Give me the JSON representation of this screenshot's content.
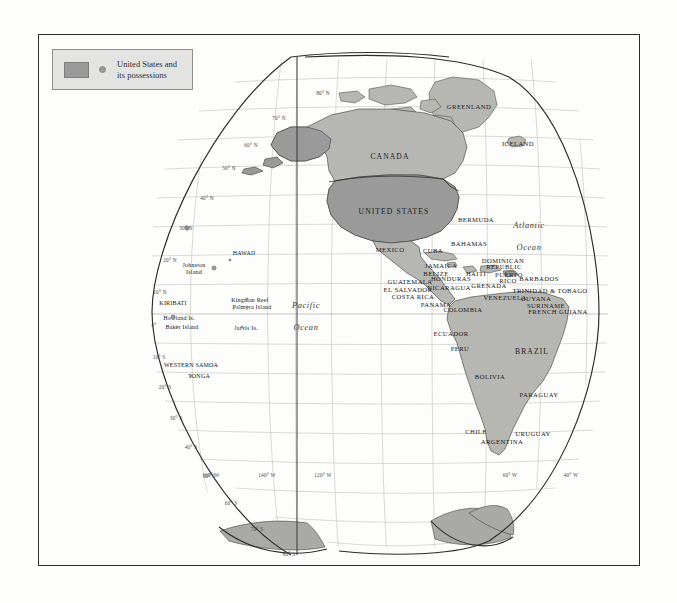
{
  "legend": {
    "swatch_name": "united-states-fill-swatch",
    "dot_name": "possession-dot-swatch",
    "line1": "United States and",
    "line2": "its possessions",
    "fill_color": "#9a9a9a",
    "box_color": "#e3e3e1"
  },
  "map": {
    "projection": "interrupted-sinusoidal",
    "highlight_color": "#9a9a9a",
    "land_color": "#b6b6b3",
    "graticule_color": "#b9b9b4",
    "coast_color": "#3a3a36",
    "ocean_color": "#fdfdfb"
  },
  "oceans": [
    {
      "name": "pacific-ocean-label",
      "line1": "Pacific",
      "line2": "Ocean",
      "x": 267,
      "y": 270
    },
    {
      "name": "atlantic-ocean-label",
      "line1": "Atlantic",
      "line2": "Ocean",
      "x": 490,
      "y": 190
    }
  ],
  "countries": [
    {
      "label": "CANADA",
      "x": 351,
      "y": 121,
      "size": "ctry-md"
    },
    {
      "label": "UNITED STATES",
      "x": 355,
      "y": 176,
      "size": "ctry-md"
    },
    {
      "label": "GREENLAND",
      "x": 430,
      "y": 71,
      "size": "ctry"
    },
    {
      "label": "ICELAND",
      "x": 479,
      "y": 108,
      "size": "ctry"
    },
    {
      "label": "BERMUDA",
      "x": 437,
      "y": 184,
      "size": "ctry"
    },
    {
      "label": "MEXICO",
      "x": 351,
      "y": 214,
      "size": "ctry"
    },
    {
      "label": "BAHAMAS",
      "x": 430,
      "y": 208,
      "size": "ctry"
    },
    {
      "label": "CUBA",
      "x": 394,
      "y": 215,
      "size": "ctry"
    },
    {
      "label": "JAMAICA",
      "x": 402,
      "y": 230,
      "size": "ctry"
    },
    {
      "label": "HAITI",
      "x": 437,
      "y": 238,
      "size": "ctry"
    },
    {
      "label": "DOMINICAN",
      "x": 464,
      "y": 225,
      "size": "ctry"
    },
    {
      "label": "REPUBLIC",
      "x": 465,
      "y": 231,
      "size": "ctry"
    },
    {
      "label": "PUERTO",
      "x": 470,
      "y": 239,
      "size": "ctry"
    },
    {
      "label": "RICO",
      "x": 469,
      "y": 245,
      "size": "ctry"
    },
    {
      "label": "BELIZE",
      "x": 397,
      "y": 238,
      "size": "ctry"
    },
    {
      "label": "HONDURAS",
      "x": 412,
      "y": 243,
      "size": "ctry"
    },
    {
      "label": "GUATEMALA",
      "x": 371,
      "y": 246,
      "size": "ctry"
    },
    {
      "label": "EL SALVADOR",
      "x": 369,
      "y": 254,
      "size": "ctry"
    },
    {
      "label": "NICARAGUA",
      "x": 410,
      "y": 252,
      "size": "ctry"
    },
    {
      "label": "COSTA RICA",
      "x": 374,
      "y": 261,
      "size": "ctry"
    },
    {
      "label": "PANAMA",
      "x": 397,
      "y": 269,
      "size": "ctry"
    },
    {
      "label": "GRENADA",
      "x": 450,
      "y": 250,
      "size": "ctry"
    },
    {
      "label": "BARBADOS",
      "x": 500,
      "y": 243,
      "size": "ctry"
    },
    {
      "label": "TRINIDAD & TOBAGO",
      "x": 511,
      "y": 255,
      "size": "ctry"
    },
    {
      "label": "GUYANA",
      "x": 497,
      "y": 263,
      "size": "ctry"
    },
    {
      "label": "SURINAME",
      "x": 507,
      "y": 270,
      "size": "ctry"
    },
    {
      "label": "FRENCH GUIANA",
      "x": 519,
      "y": 276,
      "size": "ctry"
    },
    {
      "label": "VENEZUELA",
      "x": 466,
      "y": 262,
      "size": "ctry"
    },
    {
      "label": "COLOMBIA",
      "x": 424,
      "y": 274,
      "size": "ctry"
    },
    {
      "label": "ECUADOR",
      "x": 412,
      "y": 298,
      "size": "ctry"
    },
    {
      "label": "PERU",
      "x": 421,
      "y": 313,
      "size": "ctry"
    },
    {
      "label": "BRAZIL",
      "x": 493,
      "y": 316,
      "size": "ctry-md"
    },
    {
      "label": "BOLIVIA",
      "x": 451,
      "y": 341,
      "size": "ctry"
    },
    {
      "label": "PARAGUAY",
      "x": 500,
      "y": 359,
      "size": "ctry"
    },
    {
      "label": "CHILE",
      "x": 437,
      "y": 396,
      "size": "ctry"
    },
    {
      "label": "ARGENTINA",
      "x": 463,
      "y": 406,
      "size": "ctry"
    },
    {
      "label": "URUGUAY",
      "x": 494,
      "y": 398,
      "size": "ctry"
    }
  ],
  "islands": [
    {
      "label": "HAWAII",
      "x": 205,
      "y": 218,
      "dot_x": 190,
      "dot_y": 224,
      "dot": "sm",
      "align": "left"
    },
    {
      "label": "Johnston",
      "x": 155,
      "y": 230,
      "size": "isl"
    },
    {
      "label": "Island",
      "x": 155,
      "y": 237,
      "size": "isl"
    },
    {
      "label": "KIRIBATI",
      "x": 134,
      "y": 268,
      "size": "isl"
    },
    {
      "label": "Kingman Reef",
      "x": 211,
      "y": 265,
      "size": "isl",
      "align": "left"
    },
    {
      "label": "Palmyra Island",
      "x": 213,
      "y": 272,
      "size": "isl",
      "align": "left"
    },
    {
      "label": "Howland Is.",
      "x": 140,
      "y": 283,
      "size": "isl",
      "align": "left"
    },
    {
      "label": "Baker Island",
      "x": 143,
      "y": 292,
      "size": "isl",
      "align": "left"
    },
    {
      "label": "Jarvis Is.",
      "x": 207,
      "y": 293,
      "size": "isl",
      "align": "left"
    },
    {
      "label": "WESTERN SAMOA",
      "x": 152,
      "y": 330,
      "size": "isl"
    },
    {
      "label": "TONGA",
      "x": 160,
      "y": 341,
      "size": "isl"
    }
  ],
  "island_dots": [
    {
      "name": "wake-island-dot",
      "x": 148,
      "y": 193,
      "sz": ""
    },
    {
      "name": "johnston-island-dot",
      "x": 175,
      "y": 233,
      "sz": ""
    },
    {
      "name": "hawaii-dot",
      "x": 191,
      "y": 225,
      "sz": "sm"
    },
    {
      "name": "kingman-reef-dot",
      "x": 208,
      "y": 264,
      "sz": "sm"
    },
    {
      "name": "palmyra-island-dot",
      "x": 208,
      "y": 272,
      "sz": "sm"
    },
    {
      "name": "howland-island-dot",
      "x": 134,
      "y": 282,
      "sz": ""
    },
    {
      "name": "baker-island-dot",
      "x": 138,
      "y": 292,
      "sz": "sm"
    },
    {
      "name": "jarvis-island-dot",
      "x": 203,
      "y": 292,
      "sz": "sm"
    },
    {
      "name": "tonga-dot",
      "x": 152,
      "y": 341,
      "sz": "sm"
    },
    {
      "name": "midway-dot",
      "x": 148,
      "y": 194,
      "sz": "sm"
    }
  ],
  "graticule": {
    "latitude_labels": [
      {
        "text": "80° N",
        "x": 284,
        "y": 58
      },
      {
        "text": "70° N",
        "x": 240,
        "y": 83
      },
      {
        "text": "60° N",
        "x": 212,
        "y": 110
      },
      {
        "text": "50° N",
        "x": 190,
        "y": 133
      },
      {
        "text": "40° N",
        "x": 168,
        "y": 163
      },
      {
        "text": "30° N",
        "x": 147,
        "y": 193
      },
      {
        "text": "20° N",
        "x": 131,
        "y": 225
      },
      {
        "text": "10° N",
        "x": 121,
        "y": 257
      },
      {
        "text": "0°",
        "x": 115,
        "y": 290
      },
      {
        "text": "10° S",
        "x": 120,
        "y": 322
      },
      {
        "text": "20° S",
        "x": 126,
        "y": 352
      },
      {
        "text": "30° S",
        "x": 137,
        "y": 383
      },
      {
        "text": "40° S",
        "x": 152,
        "y": 412
      },
      {
        "text": "50° S",
        "x": 170,
        "y": 441
      },
      {
        "text": "60° S",
        "x": 192,
        "y": 468
      },
      {
        "text": "70° S",
        "x": 218,
        "y": 494
      },
      {
        "text": "80° S",
        "x": 250,
        "y": 519
      }
    ],
    "longitude_labels": [
      {
        "text": "160° W",
        "x": 172,
        "y": 440
      },
      {
        "text": "140° W",
        "x": 228,
        "y": 440
      },
      {
        "text": "120° W",
        "x": 284,
        "y": 440
      },
      {
        "text": "60° W",
        "x": 471,
        "y": 440
      },
      {
        "text": "40° W",
        "x": 532,
        "y": 440
      }
    ]
  }
}
